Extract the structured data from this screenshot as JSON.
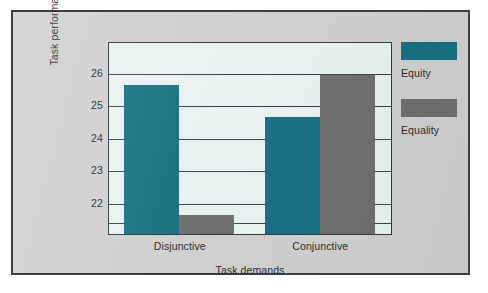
{
  "chart_data": {
    "type": "bar",
    "title": "",
    "xlabel": "Task demands",
    "ylabel": "Task performance",
    "categories": [
      "Disjunctive",
      "Conjunctive"
    ],
    "series": [
      {
        "name": "Equity",
        "color": "#14707f",
        "values": [
          25.7,
          24.7
        ]
      },
      {
        "name": "Equality",
        "color": "#6e6e6e",
        "values": [
          21.7,
          26.0
        ]
      }
    ],
    "ylim": [
      21.1,
      26.95
    ],
    "yticks": [
      26,
      25,
      24,
      23,
      22
    ],
    "ytick_labels": [
      "26",
      "25",
      "24",
      "23",
      "22"
    ],
    "extra_gridlines": [
      21.4
    ],
    "grid": true,
    "legend_position": "right",
    "plot_background": "#e9f1f1",
    "figure_background": "#cfcfcf",
    "axis_color": "#30383c"
  },
  "legend": {
    "entries": [
      {
        "label": "Equity",
        "color": "#14707f"
      },
      {
        "label": "Equality",
        "color": "#6e6e6e"
      }
    ]
  }
}
